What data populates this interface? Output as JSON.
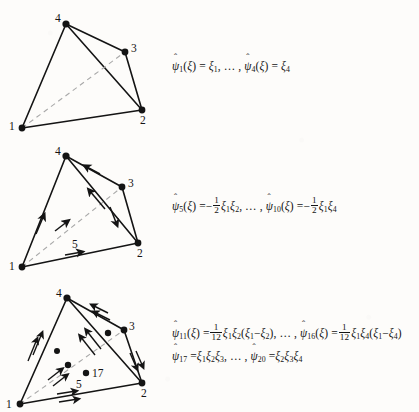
{
  "page": {
    "background_color": "#fdfcfa",
    "ink_color": "#141414",
    "dashed_edge_color": "#a9a9a9"
  },
  "figures": [
    {
      "id": "tetrahedron-linear",
      "caption_index": 1,
      "vertex_labels": [
        "1",
        "2",
        "3",
        "4"
      ],
      "interior_labels": [],
      "edge_arrows": "none",
      "description": "tetrahedron with four corner nodes and one hidden dashed edge"
    },
    {
      "id": "tetrahedron-quadratic",
      "caption_index": 2,
      "vertex_labels": [
        "1",
        "2",
        "3",
        "4"
      ],
      "interior_labels": [
        "5"
      ],
      "edge_arrows": "single",
      "description": "tetrahedron with single arrowheads along each edge and mid-edge node label 5"
    },
    {
      "id": "tetrahedron-cubic",
      "caption_index": 3,
      "vertex_labels": [
        "1",
        "2",
        "3",
        "4"
      ],
      "interior_labels": [
        "5",
        "17"
      ],
      "edge_arrows": "double",
      "description": "tetrahedron with double arrowheads along each edge, interior face nodes and label 17"
    }
  ],
  "formulas": {
    "row1": {
      "psi_left_index": "1",
      "arg": "ξ",
      "eq": "=",
      "value_left": "ξ",
      "value_left_sub": "1",
      "ellipsis": ", … ,",
      "psi_right_index": "4",
      "value_right": "ξ",
      "value_right_sub": "4"
    },
    "row2": {
      "psi_left_index": "5",
      "arg": "ξ",
      "eq": "=",
      "sign": "−",
      "frac_num": "1",
      "frac_den": "2",
      "left_terms": [
        [
          "ξ",
          "1"
        ],
        [
          "ξ",
          "2"
        ]
      ],
      "ellipsis": ", … ,",
      "psi_right_index": "10",
      "right_terms": [
        [
          "ξ",
          "1"
        ],
        [
          "ξ",
          "4"
        ]
      ]
    },
    "row3": {
      "psi_left_index": "11",
      "arg": "ξ",
      "eq": "=",
      "frac_num": "1",
      "frac_den": "12",
      "left_terms": [
        [
          "ξ",
          "1"
        ],
        [
          "ξ",
          "2"
        ]
      ],
      "left_paren": [
        "ξ",
        "1",
        "−",
        "ξ",
        "2"
      ],
      "ellipsis": ", … ,",
      "psi_right_index": "16",
      "right_terms": [
        [
          "ξ",
          "1"
        ],
        [
          "ξ",
          "4"
        ]
      ],
      "right_paren": [
        "ξ",
        "1",
        "−",
        "ξ",
        "4"
      ]
    },
    "row4": {
      "psi_left_index": "17",
      "eq": "=",
      "left_terms": [
        [
          "ξ",
          "1"
        ],
        [
          "ξ",
          "2"
        ],
        [
          "ξ",
          "3"
        ]
      ],
      "ellipsis": ", … ,",
      "psi_right_index": "20",
      "right_terms": [
        [
          "ξ",
          "2"
        ],
        [
          "ξ",
          "3"
        ],
        [
          "ξ",
          "4"
        ]
      ]
    }
  },
  "symbols": {
    "psi": "ψ",
    "hat": "ˆ",
    "xi": "ξ",
    "lparen": "(",
    "rparen": ")",
    "minus": "−",
    "comma": ","
  }
}
